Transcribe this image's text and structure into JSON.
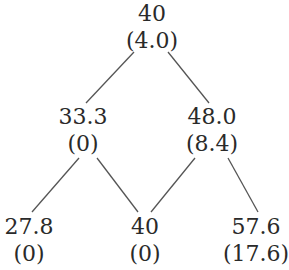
{
  "tree": {
    "levels": [
      [
        {
          "value": "40",
          "option": "(4.0)"
        }
      ],
      [
        {
          "value": "33.3",
          "option": "(0)"
        },
        {
          "value": "48.0",
          "option": "(8.4)"
        }
      ],
      [
        {
          "value": "27.8",
          "option": "(0)"
        },
        {
          "value": "40",
          "option": "(0)"
        },
        {
          "value": "57.6",
          "option": "(17.6)"
        }
      ]
    ]
  },
  "style": {
    "line_color": "#555555",
    "text_color": "#2a2a2a"
  }
}
